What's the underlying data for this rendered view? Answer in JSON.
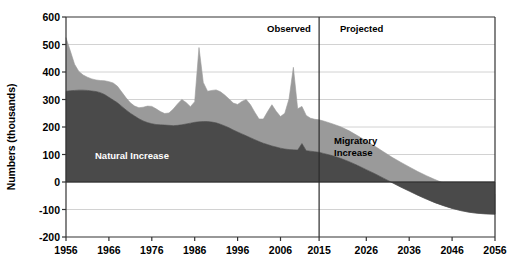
{
  "chart_data": {
    "type": "area",
    "title": "",
    "xlabel": "",
    "ylabel": "Numbers (thousands)",
    "ylim": [
      -200,
      600
    ],
    "xlim": [
      1956,
      2056
    ],
    "grid": true,
    "grid_axis": "y",
    "legend": "in-plot-labels",
    "stacked": true,
    "y_ticks": [
      600,
      500,
      400,
      300,
      200,
      100,
      0,
      -100,
      -200
    ],
    "y_tick_labels": [
      "600",
      "500",
      "400",
      "300",
      "200",
      "100",
      "0",
      "-100",
      "-200"
    ],
    "x_ticks": [
      1956,
      1966,
      1976,
      1986,
      1996,
      2006,
      2015,
      2026,
      2036,
      2046,
      2056
    ],
    "x_tick_labels": [
      "1956",
      "1966",
      "1976",
      "1986",
      "1996",
      "2006",
      "2015",
      "2026",
      "2036",
      "2046",
      "2056"
    ],
    "annotations": [
      {
        "name": "observed",
        "text": "Observed",
        "x": 2005,
        "y": 555
      },
      {
        "name": "projected",
        "text": "Projected",
        "x": 2020,
        "y": 555
      },
      {
        "name": "natural-increase",
        "text": "Natural Increase",
        "x": 1974,
        "y": 105
      },
      {
        "name": "migratory-increase-line1",
        "text": "Migratory",
        "x": 2018,
        "y": 165
      },
      {
        "name": "migratory-increase-line2",
        "text": "Increase",
        "x": 2018,
        "y": 140
      }
    ],
    "divider": {
      "name": "observed-projected-divider",
      "x": 2015,
      "label_left": "Observed",
      "label_right": "Projected"
    },
    "colors": {
      "natural_increase": "#4a4a4a",
      "migratory_increase": "#9a9a9a",
      "axis": "#333333",
      "gridline": "#d2d2d2",
      "background": "#ffffff",
      "natural_label": "#ffffff",
      "migratory_label": "#000000"
    },
    "series": [
      {
        "name": "Natural Increase",
        "key": "natural_increase",
        "x": [
          1956,
          1957,
          1958,
          1959,
          1960,
          1961,
          1962,
          1963,
          1964,
          1965,
          1966,
          1967,
          1968,
          1969,
          1970,
          1971,
          1972,
          1973,
          1974,
          1975,
          1976,
          1977,
          1978,
          1979,
          1980,
          1981,
          1982,
          1983,
          1984,
          1985,
          1986,
          1987,
          1988,
          1989,
          1990,
          1991,
          1992,
          1993,
          1994,
          1995,
          1996,
          1997,
          1998,
          1999,
          2000,
          2001,
          2002,
          2003,
          2004,
          2005,
          2006,
          2007,
          2008,
          2009,
          2010,
          2011,
          2012,
          2013,
          2014,
          2015,
          2016,
          2018,
          2020,
          2022,
          2024,
          2026,
          2028,
          2030,
          2032,
          2034,
          2036,
          2038,
          2040,
          2042,
          2044,
          2046,
          2048,
          2050,
          2052,
          2054,
          2056
        ],
        "values": [
          330,
          332,
          333,
          334,
          334,
          333,
          331,
          329,
          325,
          318,
          308,
          298,
          288,
          275,
          262,
          250,
          240,
          230,
          222,
          216,
          212,
          209,
          208,
          207,
          206,
          205,
          206,
          208,
          211,
          214,
          217,
          219,
          220,
          220,
          218,
          215,
          210,
          204,
          197,
          189,
          182,
          175,
          168,
          161,
          154,
          147,
          141,
          136,
          131,
          127,
          123,
          120,
          118,
          117,
          116,
          140,
          114,
          112,
          110,
          108,
          104,
          96,
          86,
          74,
          60,
          45,
          30,
          14,
          -2,
          -18,
          -33,
          -48,
          -62,
          -75,
          -86,
          -96,
          -104,
          -110,
          -114,
          -116,
          -117
        ]
      },
      {
        "name": "Migratory Increase",
        "key": "migratory_increase",
        "x": [
          1956,
          1957,
          1958,
          1959,
          1960,
          1961,
          1962,
          1963,
          1964,
          1965,
          1966,
          1967,
          1968,
          1969,
          1970,
          1971,
          1972,
          1973,
          1974,
          1975,
          1976,
          1977,
          1978,
          1979,
          1980,
          1981,
          1982,
          1983,
          1984,
          1985,
          1986,
          1987,
          1988,
          1989,
          1990,
          1991,
          1992,
          1993,
          1994,
          1995,
          1996,
          1997,
          1998,
          1999,
          2000,
          2001,
          2002,
          2003,
          2004,
          2005,
          2006,
          2007,
          2008,
          2009,
          2010,
          2011,
          2012,
          2013,
          2014,
          2015,
          2016,
          2018,
          2020,
          2022,
          2024,
          2026,
          2028,
          2030,
          2032,
          2034,
          2036,
          2038,
          2040,
          2042,
          2044,
          2046,
          2048,
          2050,
          2052,
          2054,
          2056
        ],
        "values": [
          195,
          145,
          95,
          68,
          55,
          48,
          44,
          42,
          44,
          50,
          57,
          62,
          60,
          52,
          44,
          38,
          36,
          40,
          50,
          60,
          63,
          57,
          48,
          42,
          45,
          60,
          78,
          92,
          78,
          60,
          75,
          270,
          142,
          110,
          115,
          120,
          118,
          112,
          105,
          98,
          100,
          118,
          132,
          120,
          100,
          82,
          88,
          120,
          150,
          130,
          115,
          130,
          185,
          300,
          150,
          135,
          128,
          120,
          118,
          118,
          118,
          116,
          115,
          112,
          108,
          104,
          100,
          96,
          92,
          90,
          88,
          86,
          85,
          84,
          82,
          80,
          78,
          76,
          75,
          74,
          73
        ]
      }
    ],
    "total_top_boundary": {
      "name": "Total Increase (Natural + Migratory)",
      "x": [
        1956,
        1957,
        1958,
        1959,
        1960,
        1961,
        1962,
        1963,
        1964,
        1965,
        1966,
        1967,
        1968,
        1969,
        1970,
        1971,
        1972,
        1973,
        1974,
        1975,
        1976,
        1977,
        1978,
        1979,
        1980,
        1981,
        1982,
        1983,
        1984,
        1985,
        1986,
        1987,
        1988,
        1989,
        1990,
        1991,
        1992,
        1993,
        1994,
        1995,
        1996,
        1997,
        1998,
        1999,
        2000,
        2001,
        2002,
        2003,
        2004,
        2005,
        2006,
        2007,
        2008,
        2009,
        2010,
        2011,
        2012,
        2013,
        2014,
        2015,
        2016,
        2018,
        2020,
        2022,
        2024,
        2026,
        2028,
        2030,
        2032,
        2034,
        2036,
        2038,
        2040,
        2042,
        2044,
        2046,
        2048,
        2050,
        2052,
        2054,
        2056
      ],
      "values": [
        525,
        477,
        428,
        402,
        389,
        381,
        375,
        371,
        369,
        368,
        365,
        360,
        348,
        327,
        306,
        288,
        276,
        270,
        272,
        276,
        275,
        266,
        256,
        249,
        251,
        265,
        284,
        300,
        289,
        274,
        292,
        489,
        362,
        330,
        333,
        335,
        328,
        316,
        302,
        287,
        282,
        293,
        300,
        281,
        254,
        229,
        229,
        256,
        281,
        257,
        238,
        250,
        303,
        417,
        266,
        275,
        242,
        232,
        228,
        226,
        222,
        212,
        201,
        186,
        168,
        149,
        130,
        110,
        90,
        72,
        55,
        38,
        23,
        9,
        -4,
        -16,
        -26,
        -34,
        -39,
        -42,
        -44
      ]
    }
  }
}
